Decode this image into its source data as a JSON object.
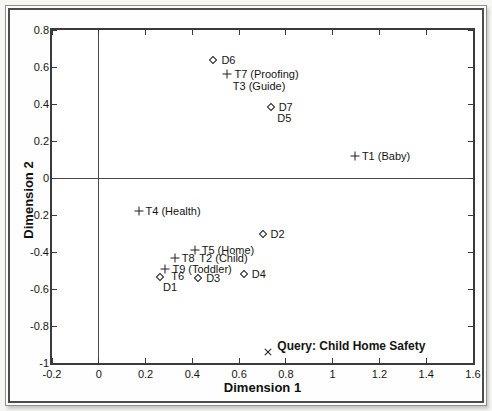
{
  "chart_data": {
    "type": "scatter",
    "title": "",
    "xlabel": "Dimension 1",
    "ylabel": "Dimension 2",
    "xlim": [
      -0.2,
      1.6
    ],
    "ylim": [
      -1,
      0.8
    ],
    "x_tick_values": [
      -0.2,
      0,
      0.2,
      0.4,
      0.6,
      0.8,
      1,
      1.2,
      1.4,
      1.6
    ],
    "x_tick_labels": [
      "-0.2",
      "0",
      "0.2",
      "0.4",
      "0.6",
      "0.8",
      "1",
      "1.2",
      "1.4",
      "1.6"
    ],
    "y_tick_values": [
      -1,
      -0.8,
      -0.6,
      -0.4,
      -0.2,
      0,
      0.2,
      0.4,
      0.6,
      0.8
    ],
    "y_tick_labels": [
      "-1",
      "-0.8",
      "-0.6",
      "-0.4",
      "-0.2",
      "0",
      "0.2",
      "0.4",
      "0.6",
      "0.8"
    ],
    "grid": false,
    "legend": "none",
    "zero_lines": true,
    "points": [
      {
        "id": "D6",
        "marker": "diamond",
        "x": 0.49,
        "y": 0.64,
        "label": "D6",
        "label_dx": 8,
        "label_dy": 0
      },
      {
        "id": "T7",
        "marker": "plus",
        "x": 0.55,
        "y": 0.56,
        "label": "T7 (Proofing)",
        "label_dx": 7,
        "label_dy": 0
      },
      {
        "id": "D7",
        "marker": "diamond",
        "x": 0.735,
        "y": 0.385,
        "label": "D7",
        "label_dx": 8,
        "label_dy": 0
      },
      {
        "id": "T1",
        "marker": "plus",
        "x": 1.095,
        "y": 0.12,
        "label": "T1 (Baby)",
        "label_dx": 7,
        "label_dy": 0
      },
      {
        "id": "T4",
        "marker": "plus",
        "x": 0.17,
        "y": -0.18,
        "label": "T4 (Health)",
        "label_dx": 7,
        "label_dy": 0
      },
      {
        "id": "D2",
        "marker": "diamond",
        "x": 0.7,
        "y": -0.305,
        "label": "D2",
        "label_dx": 8,
        "label_dy": 0
      },
      {
        "id": "T5",
        "marker": "plus",
        "x": 0.41,
        "y": -0.39,
        "label": "T5 (Home)",
        "label_dx": 7,
        "label_dy": 0
      },
      {
        "id": "T8",
        "marker": "plus",
        "x": 0.325,
        "y": -0.43,
        "label": "T8",
        "label_dx": 7,
        "label_dy": 0
      },
      {
        "id": "T9",
        "marker": "plus",
        "x": 0.285,
        "y": -0.49,
        "label": "T9 (Toddler)",
        "label_dx": 7,
        "label_dy": 0
      },
      {
        "id": "D1",
        "marker": "diamond",
        "x": 0.26,
        "y": -0.535,
        "label": "",
        "label_dx": 0,
        "label_dy": 0
      },
      {
        "id": "D3",
        "marker": "diamond",
        "x": 0.425,
        "y": -0.54,
        "label": "D3",
        "label_dx": 8,
        "label_dy": 0
      },
      {
        "id": "D4",
        "marker": "diamond",
        "x": 0.62,
        "y": -0.52,
        "label": "D4",
        "label_dx": 8,
        "label_dy": 0
      },
      {
        "id": "Query",
        "marker": "cross",
        "x": 0.725,
        "y": -0.94,
        "label": "Query: Child Home Safety",
        "label_dx": 9,
        "label_dy": -6,
        "bold": true
      }
    ],
    "text_annotations": [
      {
        "id": "T3",
        "text": "T3 (Guide)",
        "x": 0.573,
        "y": 0.5
      },
      {
        "id": "D5",
        "text": "D5",
        "x": 0.763,
        "y": 0.325
      },
      {
        "id": "T2",
        "text": "T2 (Child)",
        "x": 0.43,
        "y": -0.43
      },
      {
        "id": "T6",
        "text": "T6",
        "x": 0.31,
        "y": -0.53
      },
      {
        "id": "D1-label",
        "text": "D1",
        "x": 0.275,
        "y": -0.59
      }
    ]
  },
  "colors": {
    "page_background": "#f6f6f3",
    "plot_background": "#ffffff",
    "axis_frame": "#3a3a3a",
    "zero_line": "#4a4a4a",
    "marker": "#1e1e1e",
    "text": "#111111",
    "outer_frame_border": "#8f8f8f",
    "inner_frame_border": "#4c4c4c"
  }
}
